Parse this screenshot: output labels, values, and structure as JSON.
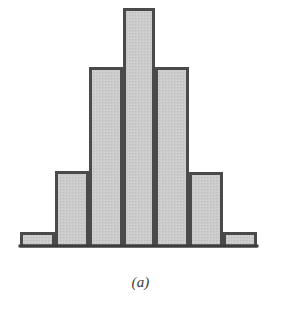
{
  "figure": {
    "caption": "(a)",
    "caption_name": "figure-label-a"
  },
  "style": {
    "bar_fill": "#cbcbcb",
    "bar_stroke": "#4a4a4a",
    "baseline_color": "#3d3d3d",
    "background": "#ffffff",
    "stroke_width": 3,
    "baseline_width": 3
  },
  "chart_data": {
    "type": "bar",
    "title": "",
    "subtitle": "",
    "xlabel": "",
    "ylabel": "",
    "grid": false,
    "legend": null,
    "annotations": [
      "(a)"
    ],
    "categories": [
      "1",
      "2",
      "3",
      "4",
      "5",
      "6",
      "7"
    ],
    "tick_labels": [],
    "values": [
      14,
      75,
      179,
      238,
      179,
      74,
      14
    ],
    "ylim": [
      0,
      246
    ],
    "xlim": [
      20,
      257
    ],
    "bars": [
      {
        "index": 0,
        "x0": 20,
        "x1": 55,
        "top": 232,
        "height": 14
      },
      {
        "index": 1,
        "x0": 55,
        "x1": 89,
        "top": 171,
        "height": 75
      },
      {
        "index": 2,
        "x0": 89,
        "x1": 123,
        "top": 67,
        "height": 179
      },
      {
        "index": 3,
        "x0": 123,
        "x1": 155,
        "top": 8,
        "height": 238
      },
      {
        "index": 4,
        "x0": 155,
        "x1": 189,
        "top": 67,
        "height": 179
      },
      {
        "index": 5,
        "x0": 189,
        "x1": 223,
        "top": 172,
        "height": 74
      },
      {
        "index": 6,
        "x0": 223,
        "x1": 257,
        "top": 232,
        "height": 14
      }
    ],
    "baseline_y": 246
  }
}
